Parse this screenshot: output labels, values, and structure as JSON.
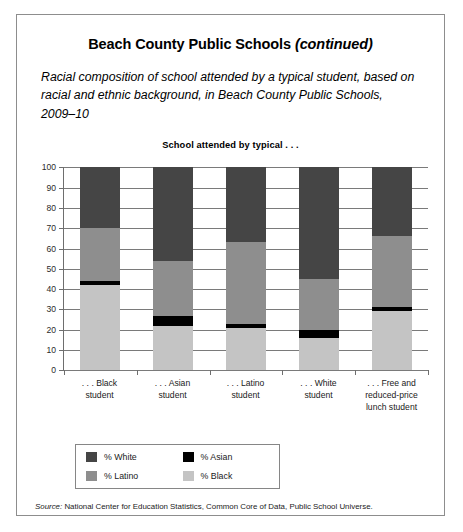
{
  "header": {
    "title_main": "Beach County Public Schools",
    "title_continued": "(continued)",
    "subtitle": "Racial composition of school attended by a typical student, based on racial and ethnic background, in Beach County Public Schools, 2009–10"
  },
  "source": {
    "lead": "Source:",
    "text": " National Center for Education Statistics, Common Core of Data, Public School Universe."
  },
  "chart_data": {
    "type": "bar",
    "subtype": "stacked-percent",
    "title": "School attended by typical . . .",
    "xlabel": "",
    "ylabel": "",
    "ylim": [
      0,
      100
    ],
    "ytick_step": 10,
    "yticks": [
      "100",
      "90",
      "80",
      "70",
      "60",
      "50",
      "40",
      "30",
      "20",
      "10",
      "0"
    ],
    "grid": true,
    "legend_position": "below-plot-left",
    "categories": [
      ". . . Black student",
      ". . . Asian student",
      ". . . Latino student",
      ". . . White student",
      ". . . Free and reduced-price lunch student"
    ],
    "category_lines": [
      [
        ". . . Black",
        "student"
      ],
      [
        ". . . Asian",
        "student"
      ],
      [
        ". . . Latino",
        "student"
      ],
      [
        ". . . White",
        "student"
      ],
      [
        ". . . Free and",
        "reduced-price",
        "lunch student"
      ]
    ],
    "series": [
      {
        "name": "% White",
        "color": "#454545",
        "values": [
          30,
          46,
          37,
          55,
          34
        ]
      },
      {
        "name": "% Latino",
        "color": "#8e8e8e",
        "values": [
          26,
          27,
          40,
          25,
          35
        ]
      },
      {
        "name": "% Asian",
        "color": "#000000",
        "values": [
          2,
          5,
          2,
          4,
          2
        ]
      },
      {
        "name": "% Black",
        "color": "#c4c4c4",
        "values": [
          42,
          22,
          21,
          16,
          29
        ]
      }
    ],
    "legend": [
      {
        "label": "% White",
        "color": "#454545"
      },
      {
        "label": "% Asian",
        "color": "#000000"
      },
      {
        "label": "% Latino",
        "color": "#8e8e8e"
      },
      {
        "label": "% Black",
        "color": "#c4c4c4"
      }
    ]
  }
}
